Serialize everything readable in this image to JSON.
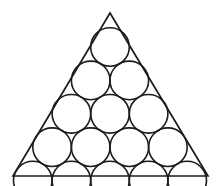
{
  "figure": {
    "background_color": "#ffffff",
    "stroke_color": "#1c1c1c",
    "fill_color": "none",
    "canvas": {
      "width": 222,
      "height": 186
    }
  },
  "chart_data": {
    "type": "diagram",
    "xlabel": "",
    "ylabel": "",
    "grid": false,
    "legend": null,
    "shapes": {
      "triangle": {
        "name": "outer-triangle",
        "stroke": "#1c1c1c",
        "stroke_width": 1.7,
        "fill": "none",
        "vertices": [
          {
            "label": "apex",
            "x": 110,
            "y": 13
          },
          {
            "label": "bottom-right",
            "x": 208,
            "y": 176
          },
          {
            "label": "bottom-left",
            "x": 13,
            "y": 176
          }
        ]
      },
      "circle_radius": 19.3,
      "circle_count": 15,
      "rows": [
        {
          "row": 1,
          "count": 1,
          "cy": 47.0,
          "centers_x": [
            110.0
          ]
        },
        {
          "row": 2,
          "count": 2,
          "cy": 80.4,
          "centers_x": [
            90.7,
            129.3
          ]
        },
        {
          "row": 3,
          "count": 3,
          "cy": 113.8,
          "centers_x": [
            71.4,
            110.0,
            148.6
          ]
        },
        {
          "row": 4,
          "count": 4,
          "cy": 147.2,
          "centers_x": [
            52.1,
            90.7,
            129.3,
            167.9
          ]
        },
        {
          "row": 5,
          "count": 5,
          "cy": 180.6,
          "centers_x": [
            32.8,
            71.4,
            110.0,
            148.6,
            187.2
          ]
        }
      ],
      "circles": [
        {
          "id": 1,
          "row": 1,
          "col": 1,
          "cx": 110.0,
          "cy": 47.0,
          "r": 19.3
        },
        {
          "id": 2,
          "row": 2,
          "col": 1,
          "cx": 90.7,
          "cy": 80.4,
          "r": 19.3
        },
        {
          "id": 3,
          "row": 2,
          "col": 2,
          "cx": 129.3,
          "cy": 80.4,
          "r": 19.3
        },
        {
          "id": 4,
          "row": 3,
          "col": 1,
          "cx": 71.4,
          "cy": 113.8,
          "r": 19.3
        },
        {
          "id": 5,
          "row": 3,
          "col": 2,
          "cx": 110.0,
          "cy": 113.8,
          "r": 19.3
        },
        {
          "id": 6,
          "row": 3,
          "col": 3,
          "cx": 148.6,
          "cy": 113.8,
          "r": 19.3
        },
        {
          "id": 7,
          "row": 4,
          "col": 1,
          "cx": 52.1,
          "cy": 147.2,
          "r": 19.3
        },
        {
          "id": 8,
          "row": 4,
          "col": 2,
          "cx": 90.7,
          "cy": 147.2,
          "r": 19.3
        },
        {
          "id": 9,
          "row": 4,
          "col": 3,
          "cx": 129.3,
          "cy": 147.2,
          "r": 19.3
        },
        {
          "id": 10,
          "row": 4,
          "col": 4,
          "cx": 167.9,
          "cy": 147.2,
          "r": 19.3
        },
        {
          "id": 11,
          "row": 5,
          "col": 1,
          "cx": 32.8,
          "cy": 180.6,
          "r": 19.3
        },
        {
          "id": 12,
          "row": 5,
          "col": 2,
          "cx": 71.4,
          "cy": 180.6,
          "r": 19.3
        },
        {
          "id": 13,
          "row": 5,
          "col": 3,
          "cx": 110.0,
          "cy": 180.6,
          "r": 19.3
        },
        {
          "id": 14,
          "row": 5,
          "col": 4,
          "cx": 148.6,
          "cy": 180.6,
          "r": 19.3
        },
        {
          "id": 15,
          "row": 5,
          "col": 5,
          "cx": 187.2,
          "cy": 180.6,
          "r": 19.3
        }
      ]
    }
  }
}
